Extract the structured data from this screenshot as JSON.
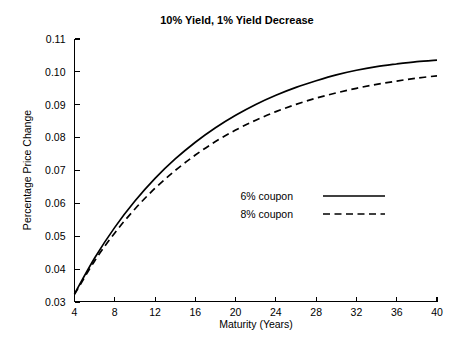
{
  "chart_data": {
    "type": "line",
    "title": "10% Yield, 1% Yield Decrease",
    "xlabel": "Maturity (Years)",
    "ylabel": "Percentage Price Change",
    "xlim": [
      4,
      40
    ],
    "ylim": [
      0.03,
      0.11
    ],
    "xticks": [
      4,
      8,
      12,
      16,
      20,
      24,
      28,
      32,
      36,
      40
    ],
    "yticks": [
      0.03,
      0.04,
      0.05,
      0.06,
      0.07,
      0.08,
      0.09,
      0.1,
      0.11
    ],
    "ytick_labels": [
      "0.03",
      "0.04",
      "0.05",
      "0.06",
      "0.07",
      "0.08",
      "0.09",
      "0.10",
      "0.11"
    ],
    "xtick_labels": [
      "4",
      "8",
      "12",
      "16",
      "20",
      "24",
      "28",
      "32",
      "36",
      "40"
    ],
    "grid": false,
    "legend_position": "center-right",
    "x": [
      4,
      6,
      8,
      10,
      12,
      14,
      16,
      18,
      20,
      22,
      24,
      26,
      28,
      30,
      32,
      34,
      36,
      38,
      40
    ],
    "series": [
      {
        "name": "6% coupon",
        "style": "solid",
        "color": "#000000",
        "values": [
          0.0325,
          0.0434,
          0.0527,
          0.0607,
          0.0676,
          0.0735,
          0.0786,
          0.083,
          0.0868,
          0.0901,
          0.0929,
          0.0953,
          0.0973,
          0.0991,
          0.1005,
          0.1016,
          0.1024,
          0.1031,
          0.1036
        ]
      },
      {
        "name": "8% coupon",
        "style": "dashed",
        "color": "#000000",
        "values": [
          0.0323,
          0.0425,
          0.051,
          0.0583,
          0.0646,
          0.07,
          0.0747,
          0.0788,
          0.0823,
          0.0853,
          0.0879,
          0.0901,
          0.092,
          0.0936,
          0.095,
          0.0962,
          0.0972,
          0.0981,
          0.0988
        ]
      }
    ]
  },
  "legend": {
    "entries": [
      {
        "label": "6% coupon"
      },
      {
        "label": "8% coupon"
      }
    ]
  }
}
